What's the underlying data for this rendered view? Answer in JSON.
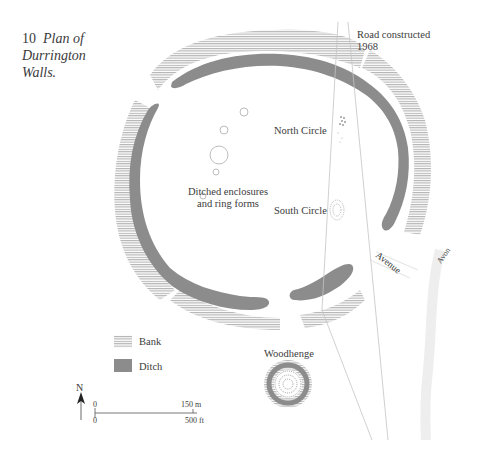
{
  "figure": {
    "number": "10",
    "title_line1": "Plan of",
    "title_line2": "Durrington",
    "title_line3": "Walls."
  },
  "labels": {
    "road_line1": "Road constructed",
    "road_line2": "1968",
    "north_circle": "North Circle",
    "south_circle": "South Circle",
    "enclosures_line1": "Ditched enclosures",
    "enclosures_line2": "and ring forms",
    "avenue": "Avenue",
    "avon": "Avon",
    "woodhenge": "Woodhenge"
  },
  "legend": {
    "items": [
      {
        "label": "Bank",
        "style": "hatched",
        "color": "#b0b0b0"
      },
      {
        "label": "Ditch",
        "style": "solid",
        "color": "#8c8c8c"
      }
    ]
  },
  "north_arrow": {
    "label": "N"
  },
  "scale_bar": {
    "top_left": "0",
    "top_right": "150 m",
    "bottom_left": "0",
    "bottom_right": "500 ft"
  },
  "colors": {
    "ditch": "#8c8c8c",
    "bank": "#b4b4b4",
    "text": "#3b3b3b",
    "road": "#c8c8c8"
  }
}
